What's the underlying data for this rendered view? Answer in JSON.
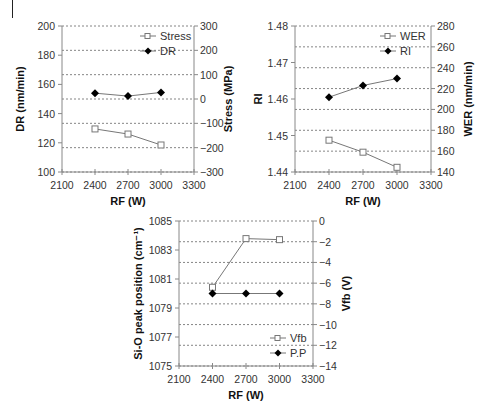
{
  "chart_data": [
    {
      "type": "line",
      "id": "chart1",
      "xlabel": "RF (W)",
      "ylabel": "DR (nm/min)",
      "y2label": "Stress (MPa)",
      "xlim": [
        2100,
        3300
      ],
      "xticks": [
        2100,
        2400,
        2700,
        3000,
        3300
      ],
      "ylim": [
        100,
        200
      ],
      "yticks": [
        100,
        120,
        140,
        160,
        180,
        200
      ],
      "y2lim": [
        -300,
        300
      ],
      "y2ticks": [
        -300,
        -200,
        -100,
        0,
        100,
        200,
        300
      ],
      "y2ticklabels": [
        "−300",
        "−200",
        "−100",
        "0",
        "100",
        "200",
        "300"
      ],
      "grid": "horizontal dashed at right-axis ticks",
      "legend": [
        "Stress",
        "DR"
      ],
      "legend_position": "upper right",
      "x": [
        2400,
        2700,
        3000
      ],
      "series": [
        {
          "name": "Stress",
          "axis": "right",
          "marker": "open-square",
          "values": [
            -123,
            -144,
            -189
          ]
        },
        {
          "name": "DR",
          "axis": "left",
          "marker": "filled-diamond",
          "values": [
            154,
            152,
            154.5
          ]
        }
      ]
    },
    {
      "type": "line",
      "id": "chart2",
      "xlabel": "RF (W)",
      "ylabel": "RI",
      "y2label": "WER (nm/min)",
      "xlim": [
        2100,
        3300
      ],
      "xticks": [
        2100,
        2400,
        2700,
        3000,
        3300
      ],
      "ylim": [
        1.44,
        1.48
      ],
      "yticks": [
        1.44,
        1.45,
        1.46,
        1.47,
        1.48
      ],
      "yticklabels": [
        "1.44",
        "1.45",
        "1.46",
        "1.47",
        "1.48"
      ],
      "y2lim": [
        140,
        280
      ],
      "y2ticks": [
        140,
        160,
        180,
        200,
        220,
        240,
        260,
        280
      ],
      "grid": "horizontal dashed at right-axis ticks",
      "legend": [
        "WER",
        "RI"
      ],
      "legend_position": "upper right",
      "x": [
        2400,
        2700,
        3000
      ],
      "series": [
        {
          "name": "WER",
          "axis": "right",
          "marker": "open-square",
          "values": [
            170.5,
            159,
            144.5
          ]
        },
        {
          "name": "RI",
          "axis": "left",
          "marker": "filled-diamond",
          "values": [
            1.4605,
            1.4637,
            1.4656
          ]
        }
      ]
    },
    {
      "type": "line",
      "id": "chart3",
      "xlabel": "RF (W)",
      "ylabel": "Si-O peak position (cm⁻¹)",
      "y2label": "Vfb (V)",
      "xlim": [
        2100,
        3300
      ],
      "xticks": [
        2100,
        2400,
        2700,
        3000,
        3300
      ],
      "ylim": [
        1075,
        1085
      ],
      "yticks": [
        1075,
        1077,
        1079,
        1081,
        1083,
        1085
      ],
      "y2lim": [
        -14,
        0
      ],
      "y2ticks": [
        -14,
        -12,
        -10,
        -8,
        -6,
        -4,
        -2,
        0
      ],
      "y2ticklabels": [
        "−14",
        "−12",
        "−10",
        "−8",
        "−6",
        "−4",
        "−2",
        "0"
      ],
      "grid": "horizontal dashed at right-axis ticks",
      "legend": [
        "Vfb",
        "P.P"
      ],
      "legend_position": "lower right",
      "x": [
        2400,
        2700,
        3000
      ],
      "series": [
        {
          "name": "Vfb",
          "axis": "right",
          "marker": "open-square",
          "values": [
            -6.4,
            -1.7,
            -1.8
          ]
        },
        {
          "name": "P.P",
          "axis": "left",
          "marker": "filled-diamond",
          "values": [
            1080.0,
            1080.0,
            1080.0
          ]
        }
      ]
    }
  ],
  "labels": {
    "c1": {
      "ylabel": "DR (nm/min)",
      "y2label": "Stress (MPa)",
      "xlabel": "RF (W)",
      "leg1": "Stress",
      "leg2": "DR"
    },
    "c2": {
      "ylabel": "RI",
      "y2label": "WER (nm/min)",
      "xlabel": "RF (W)",
      "leg1": "WER",
      "leg2": "RI"
    },
    "c3": {
      "ylabel": "Si-O peak position (cm⁻¹)",
      "y2label": "Vfb (V)",
      "xlabel": "RF (W)",
      "leg1": "Vfb",
      "leg2": "P.P"
    }
  },
  "colors": {
    "line": "#777777",
    "axis": "#888888",
    "grid": "#666666",
    "marker_filled": "#000000",
    "marker_open_stroke": "#777777"
  }
}
